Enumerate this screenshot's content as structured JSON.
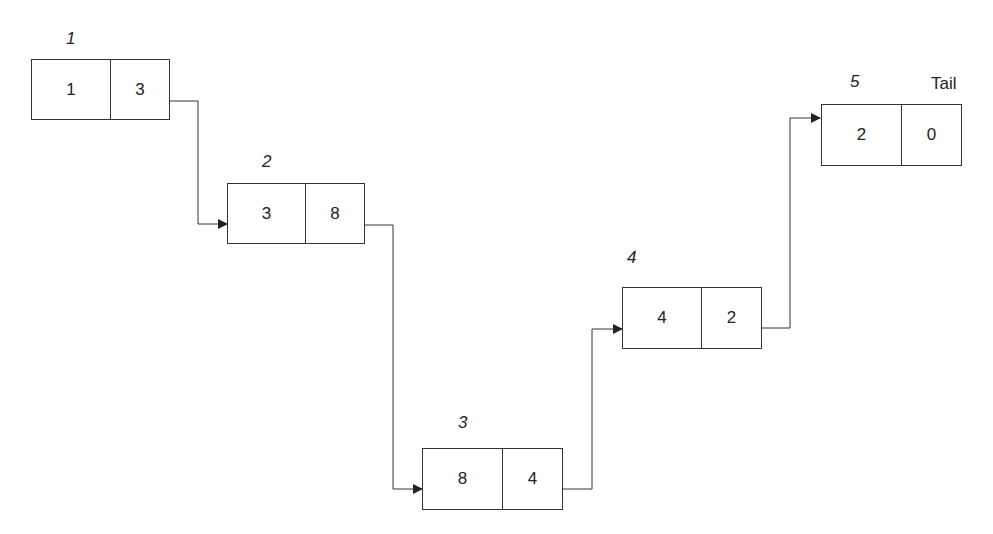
{
  "diagram": {
    "type": "linked-list",
    "nodes": [
      {
        "index": "1",
        "data": "1",
        "next": "3"
      },
      {
        "index": "2",
        "data": "3",
        "next": "8"
      },
      {
        "index": "3",
        "data": "8",
        "next": "4"
      },
      {
        "index": "4",
        "data": "4",
        "next": "2"
      },
      {
        "index": "5",
        "data": "2",
        "next": "0"
      }
    ],
    "tail_label": "Tail",
    "colors": {
      "line": "#333333",
      "background": "#ffffff"
    }
  }
}
